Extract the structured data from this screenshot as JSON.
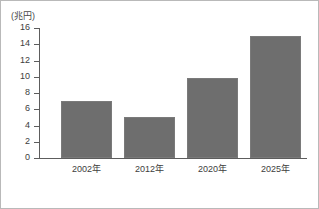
{
  "chart_data": {
    "type": "bar",
    "title": "",
    "subtitle": "",
    "xlabel": "",
    "ylabel": "(兆円)",
    "unit_label": "(兆円)",
    "categories": [
      "2002年",
      "2012年",
      "2020年",
      "2025年"
    ],
    "values": [
      7.0,
      5.1,
      9.8,
      15.0
    ],
    "series": [
      {
        "name": "",
        "values": [
          7.0,
          5.1,
          9.8,
          15.0
        ]
      }
    ],
    "ylim": [
      0,
      16
    ],
    "ytick_step": 2,
    "yticks": [
      16,
      14,
      12,
      10,
      8,
      6,
      4,
      2,
      0
    ],
    "ytick_labels": [
      "16",
      "14",
      "12",
      "10",
      "8",
      "6",
      "4",
      "2",
      "0"
    ],
    "grid": false,
    "legend": false,
    "legend_position": "none",
    "colors": {
      "bar_fill": "#6e6e6e",
      "bar_stroke": "#7a7a7a",
      "axis": "#5d5d5d",
      "text": "#3d3d3d",
      "frame": "#b9b9b9",
      "background": "#ffffff"
    }
  }
}
